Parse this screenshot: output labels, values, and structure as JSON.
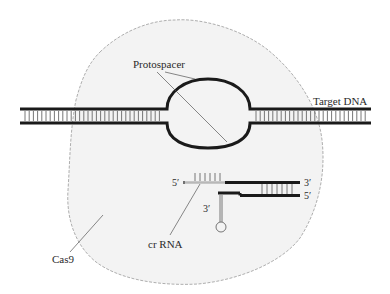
{
  "diagram": {
    "type": "CRISPR-Cas9 target recognition schematic",
    "labels": {
      "protospacer": "Protospacer",
      "target_dna": "Target DNA",
      "cas9": "Cas9",
      "crrna": "cr RNA",
      "crrna_5prime": "5′",
      "crrna_3prime": "3′",
      "tracr_5prime": "5′",
      "tracr_3prime": "3′"
    },
    "colors": {
      "strand": "#1a1a1a",
      "rung": "#555555",
      "cas9_fill": "#f3f3f3",
      "cas9_outline": "#9a9a9a",
      "leader": "#555555",
      "crrna_spacer": "#b8b8b8"
    },
    "elements": [
      {
        "id": "cas9",
        "kind": "protein blob",
        "label": "Cas9"
      },
      {
        "id": "target-dna",
        "kind": "double-stranded DNA with R-loop bubble",
        "label": "Target DNA"
      },
      {
        "id": "protospacer",
        "kind": "unwound DNA bubble",
        "label": "Protospacer"
      },
      {
        "id": "crrna",
        "kind": "guide RNA strand (5′→3′)",
        "label": "cr RNA"
      },
      {
        "id": "tracrrna",
        "kind": "trans-activating RNA with hairpin (3′ end)"
      }
    ]
  }
}
